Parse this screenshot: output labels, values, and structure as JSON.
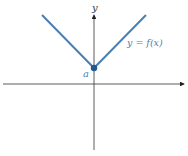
{
  "diagram": {
    "type": "function-graph",
    "axes": {
      "x_label": "",
      "y_label": "y"
    },
    "curve": {
      "label": "y = f(x)",
      "color": "#4a7fb5",
      "shape": "V",
      "vertex_label": "a"
    },
    "colors": {
      "axis": "#222222",
      "curve": "#4a7fb5",
      "point": "#1f5a96",
      "label": "#4a7fb5"
    }
  }
}
